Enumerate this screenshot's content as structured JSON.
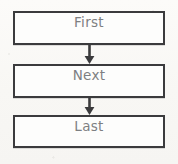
{
  "diagram": {
    "type": "flowchart",
    "orientation": "vertical",
    "background_color": "#f8f7f4",
    "border_color": "#3b3b3d",
    "text_color": "#7d7f82",
    "node_fill_color": "#fdfdfc",
    "nodes": [
      {
        "id": "first",
        "label": "First",
        "shape": "rectangle"
      },
      {
        "id": "next",
        "label": "Next",
        "shape": "rectangle"
      },
      {
        "id": "last",
        "label": "Last",
        "shape": "rectangle"
      }
    ],
    "connectors": [
      {
        "id": "first-to-next",
        "from": "first",
        "to": "next",
        "arrow": "down-arrow"
      },
      {
        "id": "next-to-last",
        "from": "next",
        "to": "last",
        "arrow": "down-arrow"
      }
    ]
  }
}
